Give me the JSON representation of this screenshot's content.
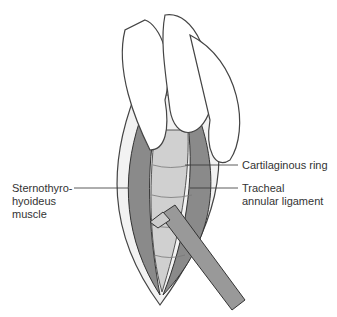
{
  "figure": {
    "labels": {
      "cartilaginous_ring": "Cartilaginous ring",
      "sternothyro_line1": "Sternothyro-",
      "sternothyro_line2": "hyoideus",
      "sternothyro_line3": "muscle",
      "tracheal_line1": "Tracheal",
      "tracheal_line2": "annular ligament"
    }
  }
}
